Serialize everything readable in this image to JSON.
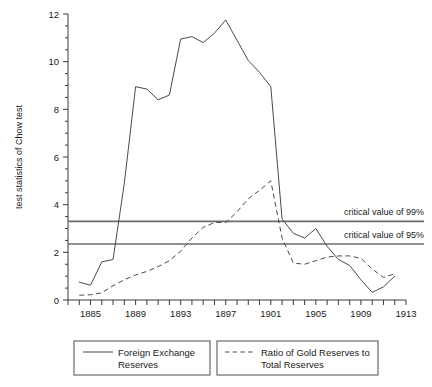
{
  "chart_data": {
    "type": "line",
    "title": "",
    "xlabel": "",
    "ylabel": "test statistics of Chow test",
    "xlim": [
      1883,
      1913
    ],
    "ylim": [
      0,
      12
    ],
    "grid": false,
    "legend_position": "bottom",
    "y_ticks": [
      0,
      2,
      4,
      6,
      8,
      10,
      12
    ],
    "y_tick_labels": [
      "0",
      "2",
      "4",
      "6",
      "8",
      "10",
      "12"
    ],
    "y_minor_tick_step": 0.5,
    "x_ticks": [
      1883,
      1884,
      1885,
      1886,
      1887,
      1888,
      1889,
      1890,
      1891,
      1892,
      1893,
      1894,
      1895,
      1896,
      1897,
      1898,
      1899,
      1900,
      1901,
      1902,
      1903,
      1904,
      1905,
      1906,
      1907,
      1908,
      1909,
      1910,
      1911,
      1912,
      1913
    ],
    "x_tick_labels_shown": [
      "1885",
      "1889",
      "1893",
      "1897",
      "1901",
      "1905",
      "1909",
      "1913"
    ],
    "x_tick_label_years": [
      1885,
      1889,
      1893,
      1897,
      1901,
      1905,
      1909,
      1913
    ],
    "series": [
      {
        "name": "Foreign Exchange Reserves",
        "style": "solid",
        "color": "#4a4a4a",
        "x": [
          1884,
          1885,
          1886,
          1887,
          1888,
          1889,
          1890,
          1891,
          1892,
          1893,
          1894,
          1895,
          1896,
          1897,
          1898,
          1899,
          1900,
          1901,
          1902,
          1903,
          1904,
          1905,
          1906,
          1907,
          1908,
          1909,
          1910,
          1911,
          1912
        ],
        "values": [
          0.75,
          0.62,
          1.6,
          1.7,
          4.9,
          8.95,
          8.85,
          8.4,
          8.6,
          10.95,
          11.05,
          10.8,
          11.2,
          11.75,
          10.9,
          10.05,
          9.55,
          8.95,
          3.4,
          2.8,
          2.6,
          3.0,
          2.25,
          1.7,
          1.45,
          0.85,
          0.32,
          0.55,
          1.0
        ]
      },
      {
        "name": "Ratio of Gold Reserves to Total Reserves",
        "style": "dashed",
        "color": "#4a4a4a",
        "x": [
          1884,
          1885,
          1886,
          1887,
          1888,
          1889,
          1890,
          1891,
          1892,
          1893,
          1894,
          1895,
          1896,
          1897,
          1898,
          1899,
          1900,
          1901,
          1902,
          1903,
          1904,
          1905,
          1906,
          1907,
          1908,
          1909,
          1910,
          1911,
          1912
        ],
        "values": [
          0.2,
          0.22,
          0.3,
          0.6,
          0.85,
          1.05,
          1.2,
          1.4,
          1.65,
          2.05,
          2.6,
          3.05,
          3.25,
          3.25,
          3.7,
          4.25,
          4.6,
          5.0,
          2.6,
          1.55,
          1.5,
          1.65,
          1.8,
          1.85,
          1.85,
          1.75,
          1.3,
          0.95,
          1.1
        ]
      }
    ],
    "reference_lines": [
      {
        "label": "critical value of 99%",
        "value": 3.3,
        "color": "#6b6b6b"
      },
      {
        "label": "critical value of 95%",
        "value": 2.35,
        "color": "#6b6b6b"
      }
    ],
    "legend_entries": [
      {
        "line1": "Foreign Exchange",
        "line2": "Reserves",
        "style": "solid"
      },
      {
        "line1": "Ratio of Gold Reserves to",
        "line2": "Total Reserves",
        "style": "dashed"
      }
    ]
  }
}
